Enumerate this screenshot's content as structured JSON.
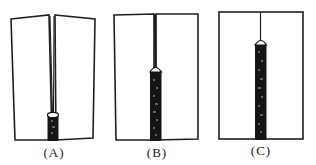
{
  "figure": {
    "colors": {
      "line": "#1f1f1f",
      "bead": "#151515",
      "bead_highlight": "#d8d8d8",
      "background": "#ffffff"
    },
    "panels": [
      {
        "id": "A",
        "label": "(A)",
        "description": "Plates open in a V; short weld bead at bottom of seam",
        "bead_top_y": 112,
        "bead_bottom_y": 140
      },
      {
        "id": "B",
        "label": "(B)",
        "description": "Plates drawn closer; weld bead covers lower half of seam",
        "bead_top_y": 68,
        "bead_bottom_y": 140
      },
      {
        "id": "C",
        "label": "(C)",
        "description": "Plates aligned; weld bead covers most of seam",
        "bead_top_y": 41,
        "bead_bottom_y": 139
      }
    ]
  }
}
